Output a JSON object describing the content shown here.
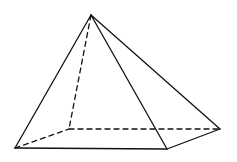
{
  "diagram": {
    "stroke_color": "#111111",
    "background": "#ffffff",
    "vertices": {
      "apex": [
        91,
        15
      ],
      "front_left": [
        15,
        148
      ],
      "front_right": [
        167,
        149
      ],
      "back_right": [
        220,
        129
      ],
      "back_left": [
        69,
        129
      ]
    },
    "edges": [
      {
        "from": "apex",
        "to": "front_left",
        "style": "solid"
      },
      {
        "from": "apex",
        "to": "front_right",
        "style": "solid"
      },
      {
        "from": "apex",
        "to": "back_right",
        "style": "solid"
      },
      {
        "from": "front_left",
        "to": "front_right",
        "style": "solid"
      },
      {
        "from": "front_right",
        "to": "back_right",
        "style": "solid"
      },
      {
        "from": "apex",
        "to": "back_left",
        "style": "dashed"
      },
      {
        "from": "front_left",
        "to": "back_left",
        "style": "dashed"
      },
      {
        "from": "back_left",
        "to": "back_right",
        "style": "dashed"
      }
    ]
  }
}
